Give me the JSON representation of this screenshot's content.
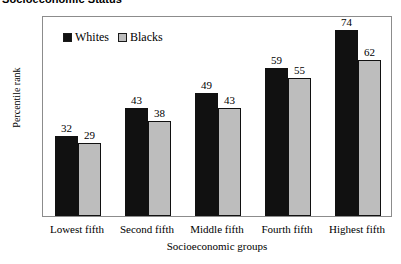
{
  "chart_data": {
    "type": "bar",
    "title": "Socioeconomic Status",
    "xlabel": "Socioeconomic groups",
    "ylabel": "Percentile rank",
    "categories": [
      "Lowest fifth",
      "Second fifth",
      "Middle fifth",
      "Fourth fifth",
      "Highest fifth"
    ],
    "series": [
      {
        "name": "Whites",
        "color": "#111111",
        "values": [
          32,
          43,
          49,
          59,
          74
        ]
      },
      {
        "name": "Blacks",
        "color": "#bdbdbd",
        "values": [
          29,
          38,
          43,
          55,
          62
        ]
      }
    ],
    "ylim": [
      0,
      80
    ],
    "yticks": [
      80,
      70,
      60,
      50,
      40,
      30,
      20,
      10,
      0
    ],
    "grid": false,
    "legend_position": "top-left-inside",
    "frame_color": "#8c8c8c",
    "background": "#ffffff"
  }
}
